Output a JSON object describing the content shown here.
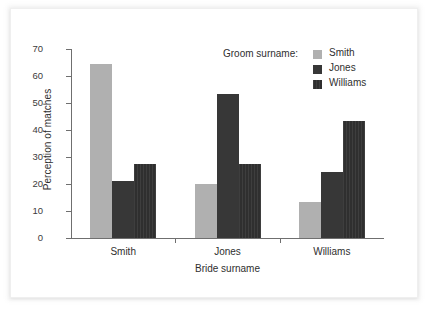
{
  "chart_data": {
    "type": "bar",
    "title": "",
    "subtitle": "",
    "xlabel": "Bride surname",
    "ylabel": "Perception of matches",
    "categories": [
      "Smith",
      "Jones",
      "Williams"
    ],
    "series": [
      {
        "name": "Smith",
        "values": [
          64.5,
          20.0,
          13.5
        ],
        "color": "#b0b0b0"
      },
      {
        "name": "Jones",
        "values": [
          21.0,
          53.5,
          24.5
        ],
        "color": "#373737"
      },
      {
        "name": "Williams",
        "values": [
          27.5,
          27.5,
          43.5
        ],
        "color": "#2f2f2f"
      }
    ],
    "legend_title": "Groom surname:",
    "legend_position": "top-right",
    "ylim": [
      0,
      70
    ],
    "yticks": [
      0,
      10,
      20,
      30,
      40,
      50,
      60,
      70
    ],
    "ytick_labels": [
      "0",
      "10",
      "20",
      "30",
      "40",
      "50",
      "60",
      "70"
    ],
    "grid": false
  }
}
